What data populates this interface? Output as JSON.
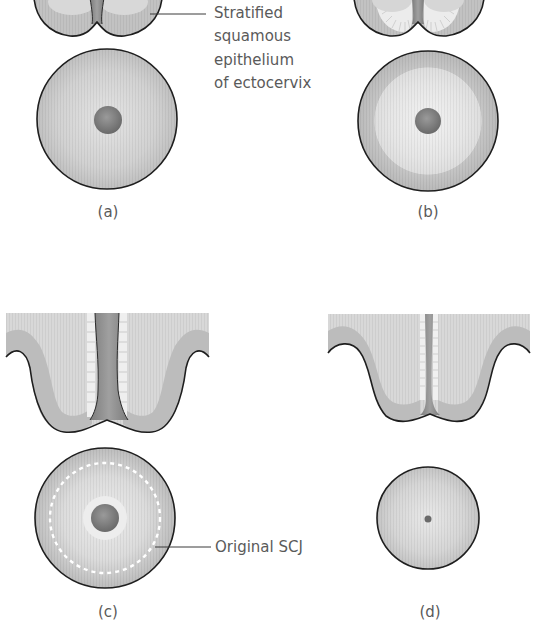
{
  "figure": {
    "panels": [
      {
        "id": "a",
        "label": "(a)",
        "description": "Cervix cross-section and face-on view, ectocervix covered by stratified squamous epithelium, os with columnar epithelium"
      },
      {
        "id": "b",
        "label": "(b)",
        "description": "Eversion of columnar epithelium onto ectocervix (ectropion)"
      },
      {
        "id": "c",
        "label": "(c)",
        "description": "Squamous metaplasia replacing everted columnar epithelium; original SCJ marked by dashed ring"
      },
      {
        "id": "d",
        "label": "(d)",
        "description": "Smaller cervix with pinpoint os; transformation complete"
      }
    ],
    "callouts": {
      "stratified": {
        "lines": [
          "Stratified",
          "squamous",
          "epithelium",
          "of ectocervix"
        ]
      },
      "scj": {
        "text": "Original SCJ"
      }
    },
    "colors": {
      "outline": "#1e1e1e",
      "stroma_light": "#d9d9d9",
      "stroma_dark": "#b3b3b3",
      "canal": "#8c8c8c",
      "columnar": "#f0f0f0",
      "os": "#7a7a7a",
      "text": "#5a5a5a",
      "dashed_ring": "#ffffff"
    }
  }
}
